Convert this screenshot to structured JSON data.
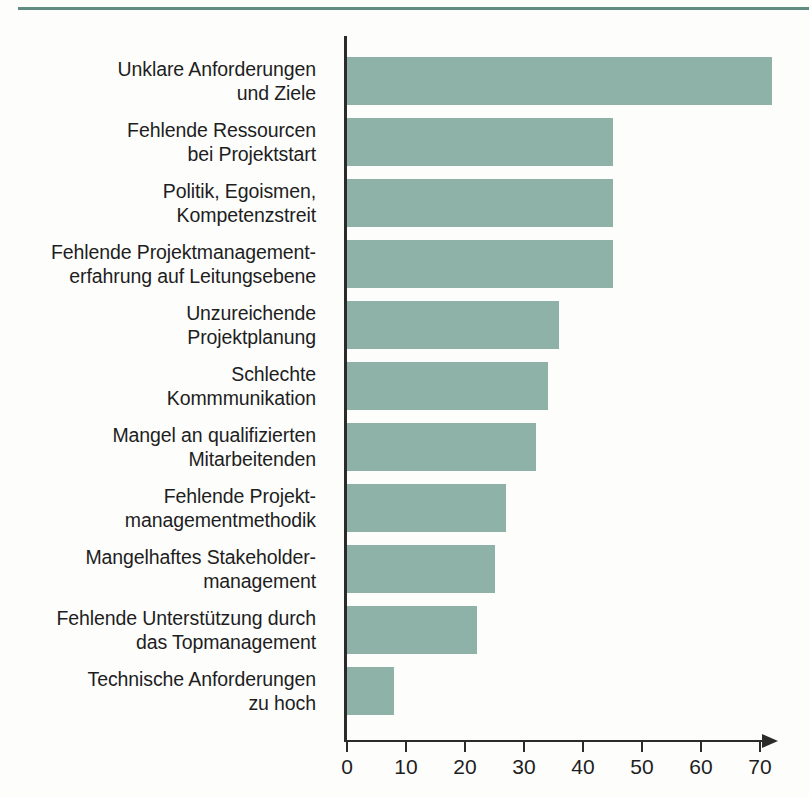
{
  "page": {
    "background_color": "#fdfdfc",
    "rule_color": "#5f8b80"
  },
  "chart_data": {
    "type": "bar",
    "orientation": "horizontal",
    "title": "",
    "subtitle": "",
    "xlabel": "",
    "ylabel": "",
    "xlim": [
      0,
      70
    ],
    "ylim": null,
    "grid": false,
    "legend": null,
    "bar_color": "#8fb2a8",
    "axis_color": "#2b2b2b",
    "xticks": [
      0,
      10,
      20,
      30,
      40,
      50,
      60,
      70
    ],
    "xtick_labels": [
      "0",
      "10",
      "20",
      "30",
      "40",
      "50",
      "60",
      "70"
    ],
    "categories": [
      "Unklare Anforderungen und Ziele",
      "Fehlende Ressourcen bei Projektstart",
      "Politik, Egoismen, Kompetenzstreit",
      "Fehlende Projektmanagement-erfahrung auf Leitungsebene",
      "Unzureichende Projektplanung",
      "Schlechte Kommmunikation",
      "Mangel an qualifizierten Mitarbeitenden",
      "Fehlende Projekt-managementmethodik",
      "Mangelhaftes Stakeholder-management",
      "Fehlende Unterstützung durch das Topmanagement",
      "Technische Anforderungen zu hoch"
    ],
    "category_lines": [
      [
        "Unklare Anforderungen",
        "und Ziele"
      ],
      [
        "Fehlende Ressourcen",
        "bei Projektstart"
      ],
      [
        "Politik, Egoismen,",
        "Kompetenzstreit"
      ],
      [
        "Fehlende Projektmanagement-",
        "erfahrung auf Leitungsebene"
      ],
      [
        "Unzureichende",
        "Projektplanung"
      ],
      [
        "Schlechte",
        "Kommmunikation"
      ],
      [
        "Mangel an qualifizierten",
        "Mitarbeitenden"
      ],
      [
        "Fehlende Projekt-",
        "managementmethodik"
      ],
      [
        "Mangelhaftes Stakeholder-",
        "management"
      ],
      [
        "Fehlende Unterstützung durch",
        "das Topmanagement"
      ],
      [
        "Technische Anforderungen",
        "zu hoch"
      ]
    ],
    "values": [
      72,
      45,
      45,
      45,
      36,
      34,
      32,
      27,
      25,
      22,
      8
    ]
  }
}
